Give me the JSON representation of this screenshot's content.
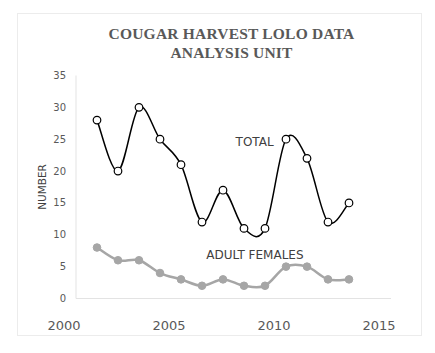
{
  "chart_data": {
    "type": "line",
    "title": "COUGAR HARVEST LOLO DATA ANALYSIS UNIT",
    "title_lines": [
      "COUGAR HARVEST LOLO DATA",
      "ANALYSIS UNIT"
    ],
    "xlabel": "",
    "ylabel": "NUMBER",
    "xlim": [
      2000,
      2015
    ],
    "ylim": [
      0,
      35
    ],
    "x_ticks": [
      2000,
      2005,
      2010,
      2015
    ],
    "y_ticks": [
      0,
      5,
      10,
      15,
      20,
      25,
      30,
      35
    ],
    "grid": false,
    "legend": "none (inline annotations)",
    "x": [
      2001,
      2002,
      2003,
      2004,
      2005,
      2006,
      2007,
      2008,
      2009,
      2010,
      2011,
      2012,
      2013
    ],
    "series": [
      {
        "name": "TOTAL",
        "values": [
          28,
          20,
          30,
          25,
          21,
          12,
          17,
          11,
          11,
          25,
          22,
          12,
          15
        ],
        "color": "#000000",
        "marker": "open-circle",
        "smooth": true
      },
      {
        "name": "ADULT FEMALES",
        "values": [
          8,
          6,
          6,
          4,
          3,
          2,
          3,
          2,
          2,
          5,
          5,
          3,
          3
        ],
        "color": "#a6a6a6",
        "marker": "filled-circle",
        "smooth": true
      }
    ],
    "annotations": [
      {
        "text": "TOTAL",
        "x": 2007.6,
        "y": 24.5
      },
      {
        "text": "ADULT FEMALES",
        "x": 2006.2,
        "y": 6.8
      }
    ]
  }
}
